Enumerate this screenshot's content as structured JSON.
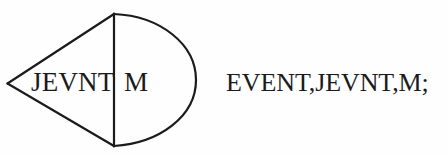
{
  "canvas": {
    "width": 448,
    "height": 155,
    "background_color": "#fefefe",
    "ink_color": "#1b1b1b"
  },
  "diagram": {
    "name": "event-symbol",
    "stroke_color": "#1b1b1b",
    "stroke_width": 2,
    "geometry": {
      "apex": [
        7,
        83
      ],
      "chord_top": [
        114,
        14
      ],
      "chord_bottom": [
        114,
        146
      ],
      "arc_right_extent": [
        196,
        80
      ]
    },
    "labels": {
      "left_label": "JEVNT",
      "right_label": "M"
    }
  },
  "caption": {
    "text": "EVENT,JEVNT,M;"
  }
}
